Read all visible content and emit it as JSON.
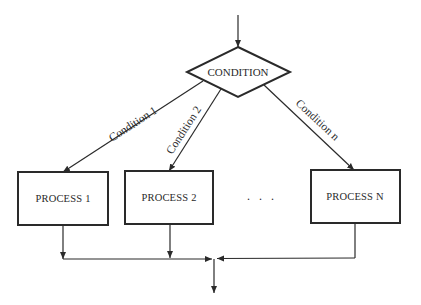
{
  "diagram": {
    "type": "flowchart",
    "decision": {
      "label": "CONDITION"
    },
    "branches": [
      {
        "edge_label": "Condition 1",
        "process_label": "PROCESS 1"
      },
      {
        "edge_label": "Condition 2",
        "process_label": "PROCESS 2"
      },
      {
        "edge_label": "Condition n",
        "process_label": "PROCESS N"
      }
    ],
    "ellipsis": ". . .",
    "colors": {
      "stroke": "#2a2a2a",
      "background": "#ffffff"
    }
  }
}
